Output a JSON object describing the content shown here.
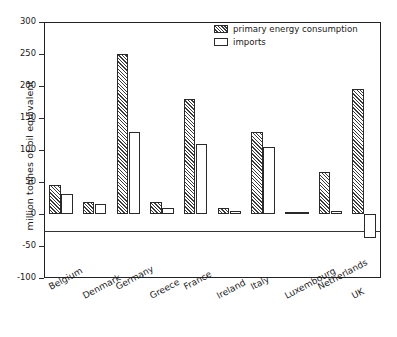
{
  "chart_data": {
    "type": "bar",
    "title": "",
    "xlabel": "",
    "ylabel": "million tonnes of oil equivalent",
    "ylim": [
      -100,
      300
    ],
    "ytick_step": 50,
    "yticks": [
      300,
      250,
      200,
      150,
      100,
      50,
      0,
      -50,
      -100
    ],
    "ytick_labels": [
      "300",
      "250",
      "200",
      "150",
      "100",
      "50",
      "0",
      "-50",
      "-100"
    ],
    "grid": false,
    "legend_position": "top-center",
    "categories": [
      "Belgium",
      "Denmark",
      "Germany",
      "Greece",
      "France",
      "Ireland",
      "Italy",
      "Luxembourg",
      "Netherlands",
      "UK"
    ],
    "series": [
      {
        "name": "primary energy consumption",
        "fill": "hatched",
        "values": [
          45,
          18,
          250,
          18,
          180,
          10,
          128,
          3,
          65,
          196
        ]
      },
      {
        "name": "imports",
        "fill": "white",
        "values": [
          32,
          16,
          128,
          10,
          110,
          5,
          105,
          3,
          5,
          -38
        ]
      }
    ]
  },
  "legend": {
    "items": [
      {
        "label": "primary energy consumption",
        "swatch": "hatched-swatch"
      },
      {
        "label": "imports",
        "swatch": "empty-swatch"
      }
    ]
  },
  "colors": {
    "axis": "#232323",
    "bar_outline": "#2a2a2a",
    "hatch": "#3a3a3a",
    "background": "#ffffff"
  }
}
